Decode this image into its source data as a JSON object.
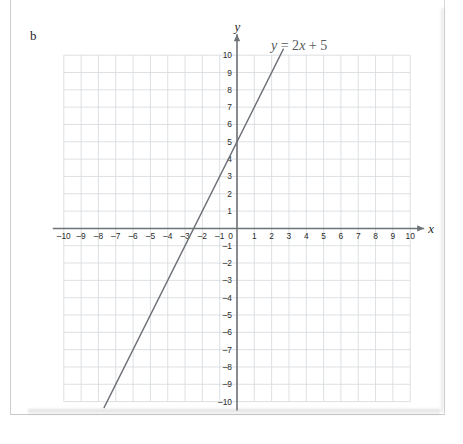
{
  "page": {
    "part_label": "b"
  },
  "chart_data": {
    "type": "line",
    "title": "",
    "equation_label": "y = 2x + 5",
    "equation_parts": {
      "y": "y",
      "eq": "=",
      "two": "2",
      "x": "x",
      "plus": "+",
      "five": "5"
    },
    "xlabel": "x",
    "ylabel": "y",
    "xlim": [
      -10,
      10
    ],
    "ylim": [
      -10,
      10
    ],
    "grid": true,
    "grid_step": 1,
    "tick_step": 1,
    "x_ticks": [
      "-10",
      "-9",
      "-8",
      "-7",
      "-6",
      "-5",
      "-4",
      "-3",
      "-2",
      "-1",
      "0",
      "1",
      "2",
      "3",
      "4",
      "5",
      "6",
      "7",
      "8",
      "9",
      "10"
    ],
    "y_ticks": [
      "10",
      "9",
      "8",
      "7",
      "6",
      "5",
      "4",
      "3",
      "2",
      "1",
      "0",
      "-1",
      "-2",
      "-3",
      "-4",
      "-5",
      "-6",
      "-7",
      "-8",
      "-9",
      "-10"
    ],
    "origin_label": "0",
    "series": [
      {
        "name": "y = 2x + 5",
        "slope": 2,
        "intercept": 5,
        "x_intercept": -2.5,
        "y_intercept": 5,
        "points": [
          {
            "x": -7.5,
            "y": -10
          },
          {
            "x": -2.5,
            "y": 0
          },
          {
            "x": 0,
            "y": 5
          },
          {
            "x": 2.5,
            "y": 10
          }
        ],
        "drawn_from": {
          "x": -9.1,
          "y": -13.2
        },
        "drawn_to": {
          "x": 3.1,
          "y": 11.2
        },
        "color": "#6b6f75"
      }
    ],
    "colors": {
      "grid": "#d7dade",
      "axis": "#6e7378",
      "line": "#6b6f75",
      "text": "#2b2b2b",
      "equation_text": "#555a60",
      "background": "#ffffff"
    },
    "axis_arrows": {
      "x": "arrow-right",
      "y": "arrow-up"
    }
  }
}
